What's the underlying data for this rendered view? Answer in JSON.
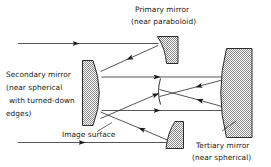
{
  "figure": {
    "kind": "optical-ray-diagram",
    "background_color": "#ffffff",
    "ink_color": "#1a1a1a",
    "ray_color": "#2b2b2b"
  },
  "labels": {
    "primary": {
      "line1": "Primary mirror",
      "line2": "(near paraboloid)"
    },
    "secondary": {
      "line1": "Secondary mirror",
      "line2": "(near spherical",
      "line3": "with turned-down",
      "line4": "edges)"
    },
    "tertiary": {
      "line1": "Tertiary mirror",
      "line2": "(near spherical)"
    },
    "image_surface": {
      "line1": "Image surface"
    }
  },
  "components": [
    {
      "name": "primary-mirror-upper",
      "role": "concave-left hatched segment"
    },
    {
      "name": "primary-mirror-lower",
      "role": "concave-left hatched segment"
    },
    {
      "name": "secondary-mirror",
      "role": "convex-right hatched segment"
    },
    {
      "name": "tertiary-mirror",
      "role": "large concave-left hatched segment"
    },
    {
      "name": "image-surface-arc",
      "role": "small curved focal surface"
    }
  ],
  "rays": {
    "incoming_count": 2,
    "description": "collimated beams enter from the left, reflect off the primary, travel to the secondary, then to the tertiary and converge on the image surface"
  }
}
